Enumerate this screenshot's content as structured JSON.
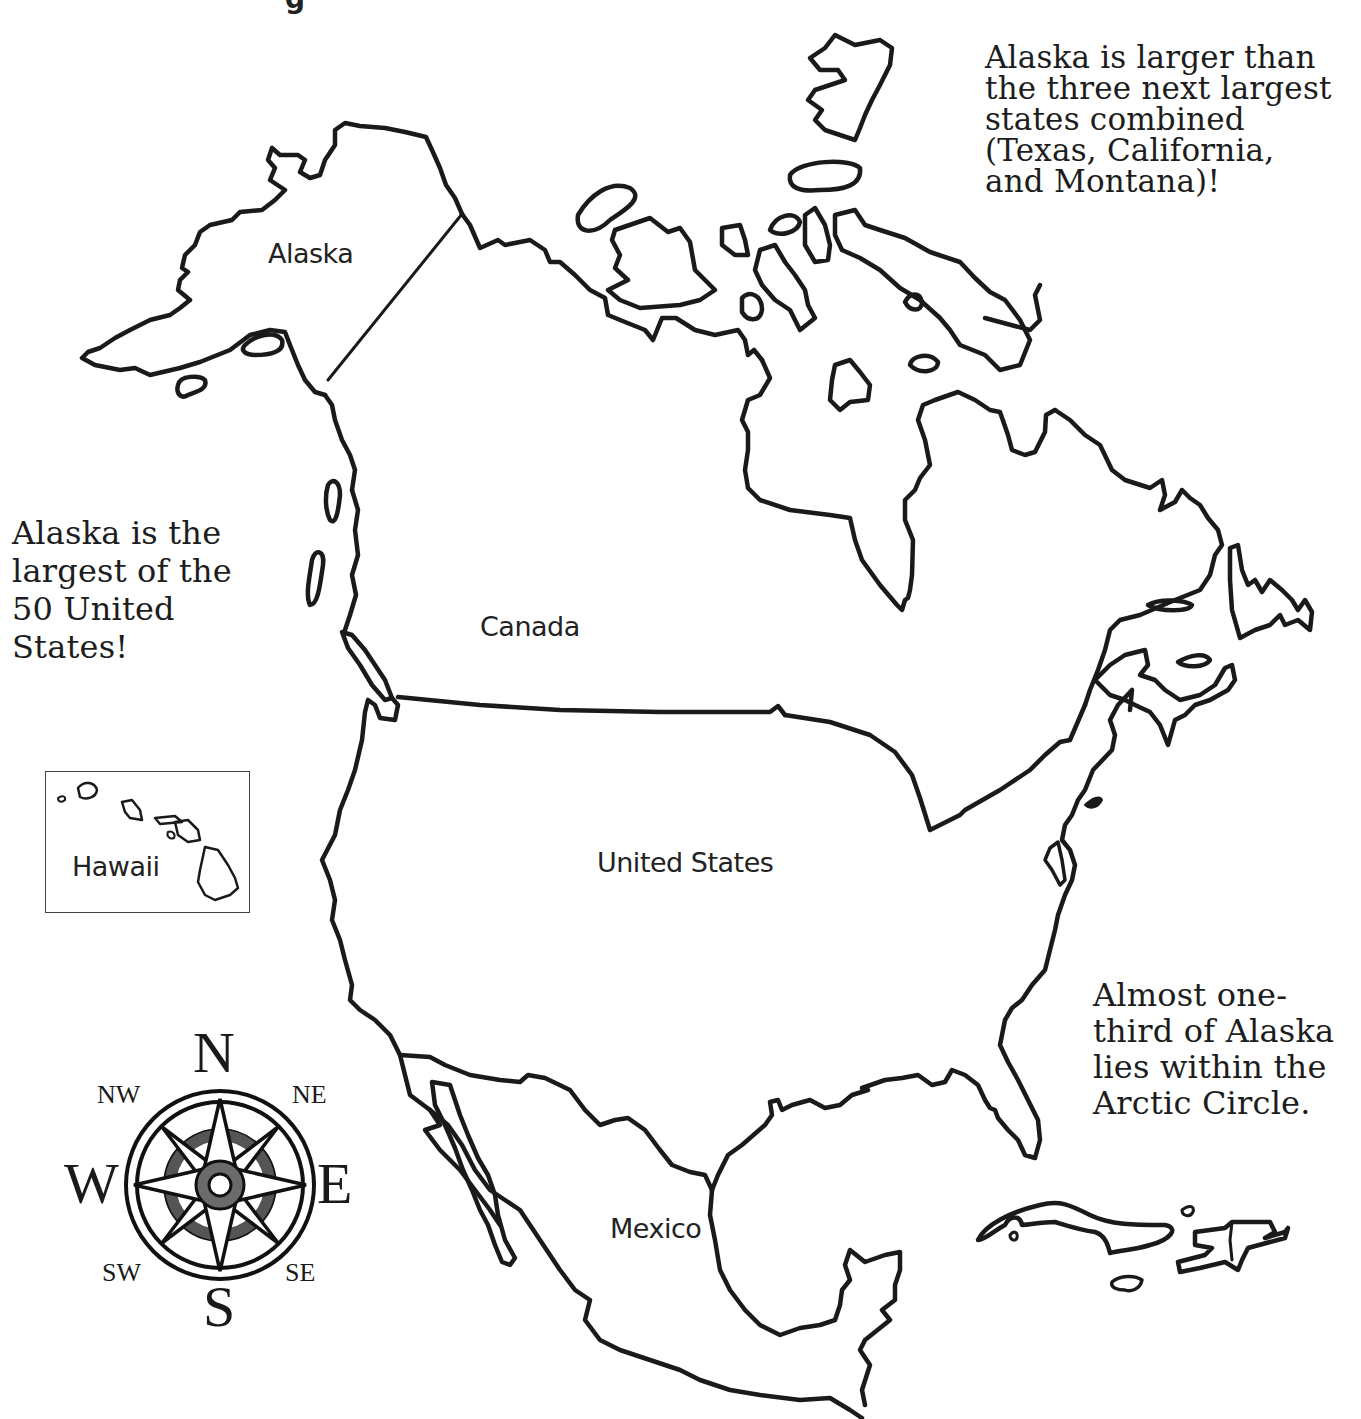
{
  "title_fragment": "g",
  "facts": {
    "top_right": "Alaska is larger than\nthe three next largest\nstates combined\n(Texas, California,\nand Montana)!",
    "left": "Alaska is the\nlargest of the\n50 United\nStates!",
    "bottom_right": "Almost one-\nthird of Alaska\nlies within the\nArctic Circle."
  },
  "regions": {
    "alaska": "Alaska",
    "canada": "Canada",
    "united_states": "United States",
    "mexico": "Mexico",
    "hawaii": "Hawaii"
  },
  "compass": {
    "n": "N",
    "s": "S",
    "e": "E",
    "w": "W",
    "ne": "NE",
    "nw": "NW",
    "se": "SE",
    "sw": "SW",
    "colors": {
      "ring": "#555555",
      "hub": "#6b6b6b",
      "line": "#111111"
    }
  },
  "style": {
    "outline_color": "#1a1a1a",
    "background": "#ffffff"
  }
}
